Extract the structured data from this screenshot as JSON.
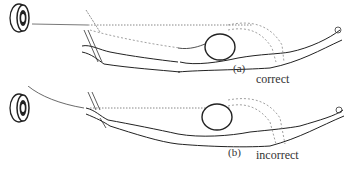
{
  "figure": {
    "panels": [
      {
        "id": "a",
        "label": "(a)",
        "caption": "correct",
        "arrow_to_target": "straight"
      },
      {
        "id": "b",
        "label": "(b)",
        "caption": "incorrect",
        "arrow_to_target": "curved"
      }
    ],
    "colors": {
      "line": "#2a2a2a",
      "dashed": "#888888",
      "background": "#ffffff"
    }
  }
}
